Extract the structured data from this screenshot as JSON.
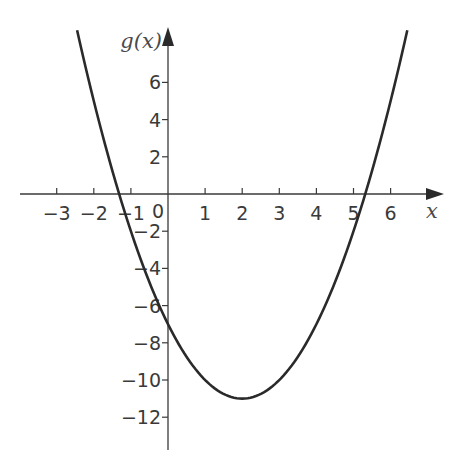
{
  "chart_data": {
    "type": "line",
    "title": "",
    "xlabel": "x",
    "ylabel": "g(x)",
    "function": "g(x) = x^2 - 4x - 7",
    "vertex": [
      2,
      -11
    ],
    "y_intercept": -7,
    "roots": [
      -1.32,
      5.32
    ],
    "x_range": [
      -2.45,
      6.45
    ],
    "xlim": [
      -4.1,
      7.4
    ],
    "ylim": [
      -13.6,
      8.9
    ],
    "grid": false,
    "legend": "none",
    "x_ticks": [
      -3,
      -2,
      -1,
      1,
      2,
      3,
      4,
      5,
      6
    ],
    "x_tick_labels": [
      "−3",
      "−2",
      "−1",
      "1",
      "2",
      "3",
      "4",
      "5",
      "6"
    ],
    "y_ticks": [
      6,
      4,
      2,
      -2,
      -4,
      -6,
      -8,
      -10,
      -12
    ],
    "y_tick_labels": [
      "6",
      "4",
      "2",
      "−2",
      "−4",
      "−6",
      "−8",
      "−10",
      "−12"
    ],
    "origin_label": "0",
    "series": [
      {
        "name": "g(x)",
        "x": [
          -2.45,
          -2,
          -1.5,
          -1,
          -0.5,
          0,
          0.5,
          1,
          1.5,
          2,
          2.5,
          3,
          3.5,
          4,
          4.5,
          5,
          5.5,
          6,
          6.45
        ],
        "y": [
          8.8,
          5,
          1.25,
          -2,
          -4.75,
          -7,
          -8.75,
          -10,
          -10.75,
          -11,
          -10.75,
          -10,
          -8.75,
          -7,
          -4.75,
          -2,
          1.25,
          5,
          8.8
        ]
      }
    ]
  }
}
